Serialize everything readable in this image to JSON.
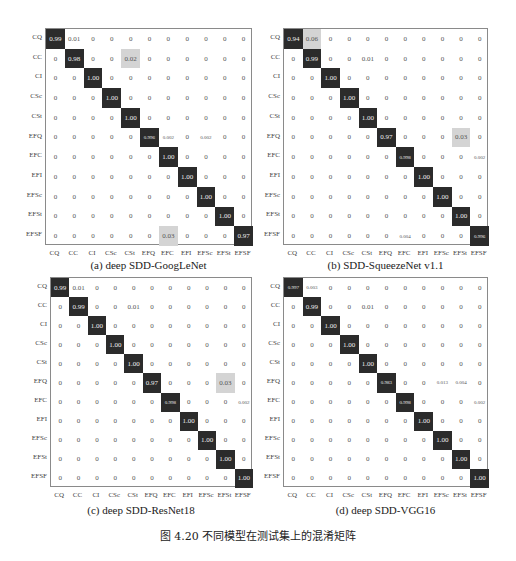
{
  "figure_caption": "图 4.20   不同模型在测试集上的混淆矩阵",
  "chart_data": [
    {
      "type": "heatmap",
      "title": "(a) deep SDD-GoogLeNet",
      "xlabel": "",
      "ylabel": "",
      "categories": [
        "CQ",
        "CC",
        "CI",
        "CSc",
        "CSt",
        "EFQ",
        "EFC",
        "EFI",
        "EFSc",
        "EFSt",
        "EFSF"
      ],
      "matrix": [
        [
          "0.99",
          "0.01",
          "0",
          "0",
          "0",
          "0",
          "0",
          "0",
          "0",
          "0",
          "0"
        ],
        [
          "0",
          "0.98",
          "0",
          "0",
          "0.02",
          "0",
          "0",
          "0",
          "0",
          "0",
          "0"
        ],
        [
          "0",
          "0",
          "1.00",
          "0",
          "0",
          "0",
          "0",
          "0",
          "0",
          "0",
          "0"
        ],
        [
          "0",
          "0",
          "0",
          "1.00",
          "0",
          "0",
          "0",
          "0",
          "0",
          "0",
          "0"
        ],
        [
          "0",
          "0",
          "0",
          "0",
          "1.00",
          "0",
          "0",
          "0",
          "0",
          "0",
          "0"
        ],
        [
          "0",
          "0",
          "0",
          "0",
          "0",
          "0.996",
          "0.002",
          "0",
          "0.002",
          "0",
          "0"
        ],
        [
          "0",
          "0",
          "0",
          "0",
          "0",
          "0",
          "1.00",
          "0",
          "0",
          "0",
          "0"
        ],
        [
          "0",
          "0",
          "0",
          "0",
          "0",
          "0",
          "0",
          "1.00",
          "0",
          "0",
          "0"
        ],
        [
          "0",
          "0",
          "0",
          "0",
          "0",
          "0",
          "0",
          "0",
          "1.00",
          "0",
          "0"
        ],
        [
          "0",
          "0",
          "0",
          "0",
          "0",
          "0",
          "0",
          "0",
          "0",
          "1.00",
          "0"
        ],
        [
          "0",
          "0",
          "0",
          "0",
          "0",
          "0",
          "0.03",
          "0",
          "0",
          "0",
          "0.97"
        ]
      ]
    },
    {
      "type": "heatmap",
      "title": "(b) SDD-SqueezeNet v1.1",
      "xlabel": "",
      "ylabel": "",
      "categories": [
        "CQ",
        "CC",
        "CI",
        "CSc",
        "CSt",
        "EFQ",
        "EFC",
        "EFI",
        "EFSc",
        "EFSt",
        "EFSF"
      ],
      "matrix": [
        [
          "0.94",
          "0.06",
          "0",
          "0",
          "0",
          "0",
          "0",
          "0",
          "0",
          "0",
          "0"
        ],
        [
          "0",
          "0.99",
          "0",
          "0",
          "0.01",
          "0",
          "0",
          "0",
          "0",
          "0",
          "0"
        ],
        [
          "0",
          "0",
          "1.00",
          "0",
          "0",
          "0",
          "0",
          "0",
          "0",
          "0",
          "0"
        ],
        [
          "0",
          "0",
          "0",
          "1.00",
          "0",
          "0",
          "0",
          "0",
          "0",
          "0",
          "0"
        ],
        [
          "0",
          "0",
          "0",
          "0",
          "1.00",
          "0",
          "0",
          "0",
          "0",
          "0",
          "0"
        ],
        [
          "0",
          "0",
          "0",
          "0",
          "0",
          "0.97",
          "0",
          "0",
          "0",
          "0.03",
          "0"
        ],
        [
          "0",
          "0",
          "0",
          "0",
          "0",
          "0",
          "0.998",
          "0",
          "0",
          "0",
          "0.002"
        ],
        [
          "0",
          "0",
          "0",
          "0",
          "0",
          "0",
          "0",
          "1.00",
          "0",
          "0",
          "0"
        ],
        [
          "0",
          "0",
          "0",
          "0",
          "0",
          "0",
          "0",
          "0",
          "1.00",
          "0",
          "0"
        ],
        [
          "0",
          "0",
          "0",
          "0",
          "0",
          "0",
          "0",
          "0",
          "0",
          "1.00",
          "0"
        ],
        [
          "0",
          "0",
          "0",
          "0",
          "0",
          "0",
          "0.004",
          "0",
          "0",
          "0",
          "0.996"
        ]
      ]
    },
    {
      "type": "heatmap",
      "title": "(c) deep SDD-ResNet18",
      "xlabel": "",
      "ylabel": "",
      "categories": [
        "CQ",
        "CC",
        "CI",
        "CSc",
        "CSt",
        "EFQ",
        "EFC",
        "EFI",
        "EFSc",
        "EFSt",
        "EFSF"
      ],
      "matrix": [
        [
          "0.99",
          "0.01",
          "0",
          "0",
          "0",
          "0",
          "0",
          "0",
          "0",
          "0",
          "0"
        ],
        [
          "0",
          "0.99",
          "0",
          "0",
          "0.01",
          "0",
          "0",
          "0",
          "0",
          "0",
          "0"
        ],
        [
          "0",
          "0",
          "1.00",
          "0",
          "0",
          "0",
          "0",
          "0",
          "0",
          "0",
          "0"
        ],
        [
          "0",
          "0",
          "0",
          "1.00",
          "0",
          "0",
          "0",
          "0",
          "0",
          "0",
          "0"
        ],
        [
          "0",
          "0",
          "0",
          "0",
          "1.00",
          "0",
          "0",
          "0",
          "0",
          "0",
          "0"
        ],
        [
          "0",
          "0",
          "0",
          "0",
          "0",
          "0.97",
          "0",
          "0",
          "0",
          "0.03",
          "0"
        ],
        [
          "0",
          "0",
          "0",
          "0",
          "0",
          "0",
          "0.998",
          "0",
          "0",
          "0",
          "0.002"
        ],
        [
          "0",
          "0",
          "0",
          "0",
          "0",
          "0",
          "0",
          "1.00",
          "0",
          "0",
          "0"
        ],
        [
          "0",
          "0",
          "0",
          "0",
          "0",
          "0",
          "0",
          "0",
          "1.00",
          "0",
          "0"
        ],
        [
          "0",
          "0",
          "0",
          "0",
          "0",
          "0",
          "0",
          "0",
          "0",
          "1.00",
          "0"
        ],
        [
          "0",
          "0",
          "0",
          "0",
          "0",
          "0",
          "0",
          "0",
          "0",
          "0",
          "1.00"
        ]
      ]
    },
    {
      "type": "heatmap",
      "title": "(d) deep SDD-VGG16",
      "xlabel": "",
      "ylabel": "",
      "categories": [
        "CQ",
        "CC",
        "CI",
        "CSc",
        "CSt",
        "EFQ",
        "EFC",
        "EFI",
        "EFSc",
        "EFSt",
        "EFSF"
      ],
      "matrix": [
        [
          "0.997",
          "0.003",
          "0",
          "0",
          "0",
          "0",
          "0",
          "0",
          "0",
          "0",
          "0"
        ],
        [
          "0",
          "0.99",
          "0",
          "0",
          "0.01",
          "0",
          "0",
          "0",
          "0",
          "0",
          "0"
        ],
        [
          "0",
          "0",
          "1.00",
          "0",
          "0",
          "0",
          "0",
          "0",
          "0",
          "0",
          "0"
        ],
        [
          "0",
          "0",
          "0",
          "1.00",
          "0",
          "0",
          "0",
          "0",
          "0",
          "0",
          "0"
        ],
        [
          "0",
          "0",
          "0",
          "0",
          "1.00",
          "0",
          "0",
          "0",
          "0",
          "0",
          "0"
        ],
        [
          "0",
          "0",
          "0",
          "0",
          "0",
          "0.983",
          "0",
          "0",
          "0.013",
          "0.004",
          "0"
        ],
        [
          "0",
          "0",
          "0",
          "0",
          "0",
          "0",
          "0.998",
          "0",
          "0",
          "0",
          "0.002"
        ],
        [
          "0",
          "0",
          "0",
          "0",
          "0",
          "0",
          "0",
          "1.00",
          "0",
          "0",
          "0"
        ],
        [
          "0",
          "0",
          "0",
          "0",
          "0",
          "0",
          "0",
          "0",
          "1.00",
          "0",
          "0"
        ],
        [
          "0",
          "0",
          "0",
          "0",
          "0",
          "0",
          "0",
          "0",
          "0",
          "1.00",
          "0"
        ],
        [
          "0",
          "0",
          "0",
          "0",
          "0",
          "0",
          "0",
          "0",
          "0",
          "0",
          "1.00"
        ]
      ]
    }
  ],
  "colors": {
    "high": "#2b2b2b",
    "mid": "#d4d4d4",
    "zero": "#ffffff",
    "frame": "#8a8a8a"
  }
}
